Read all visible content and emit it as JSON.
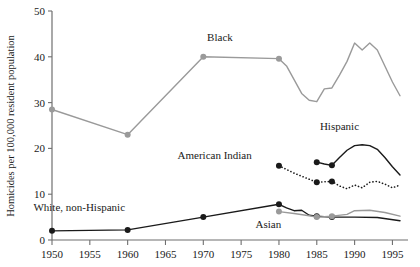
{
  "chart_data": {
    "type": "line",
    "title": "",
    "xlabel": "",
    "ylabel": "Homicides per 100,000 resident population",
    "xlim": [
      1950,
      1996
    ],
    "ylim": [
      0,
      50
    ],
    "yticks": [
      0,
      10,
      20,
      30,
      40,
      50
    ],
    "ytick_labels": [
      "0",
      "10",
      "20",
      "30",
      "40",
      "50"
    ],
    "xticks": [
      1950,
      1955,
      1960,
      1965,
      1970,
      1975,
      1980,
      1985,
      1990,
      1995
    ],
    "xtick_labels": [
      "1950",
      "1955",
      "1960",
      "1965",
      "1970",
      "1975",
      "1980",
      "1985",
      "1990",
      "1995"
    ],
    "grid": false,
    "legend": "inline-annotations",
    "series": [
      {
        "name": "Black",
        "label": "Black",
        "color": "#9a9a9a",
        "style": "solid",
        "marker": "circle",
        "label_x": 1972.2,
        "label_y": 43.5,
        "points": [
          {
            "x": 1950,
            "y": 28.5,
            "marker": true
          },
          {
            "x": 1960,
            "y": 23.0,
            "marker": true
          },
          {
            "x": 1970,
            "y": 40.0,
            "marker": true
          },
          {
            "x": 1980,
            "y": 39.6,
            "marker": true
          },
          {
            "x": 1981,
            "y": 38.0,
            "marker": false
          },
          {
            "x": 1982,
            "y": 35.0,
            "marker": false
          },
          {
            "x": 1983,
            "y": 32.0,
            "marker": false
          },
          {
            "x": 1984,
            "y": 30.5,
            "marker": false
          },
          {
            "x": 1985,
            "y": 30.2,
            "marker": false
          },
          {
            "x": 1986,
            "y": 33.0,
            "marker": false
          },
          {
            "x": 1987,
            "y": 33.2,
            "marker": false
          },
          {
            "x": 1988,
            "y": 36.0,
            "marker": false
          },
          {
            "x": 1989,
            "y": 39.0,
            "marker": false
          },
          {
            "x": 1990,
            "y": 43.0,
            "marker": false
          },
          {
            "x": 1991,
            "y": 41.5,
            "marker": false
          },
          {
            "x": 1992,
            "y": 43.0,
            "marker": false
          },
          {
            "x": 1993,
            "y": 41.5,
            "marker": false
          },
          {
            "x": 1994,
            "y": 38.0,
            "marker": false
          },
          {
            "x": 1995,
            "y": 34.5,
            "marker": false
          },
          {
            "x": 1996,
            "y": 31.5,
            "marker": false
          }
        ]
      },
      {
        "name": "Hispanic",
        "label": "Hispanic",
        "color": "#1a1a1a",
        "style": "solid",
        "marker": "circle",
        "label_x": 1988.0,
        "label_y": 24.0,
        "points": [
          {
            "x": 1985,
            "y": 17.0,
            "marker": true
          },
          {
            "x": 1986,
            "y": 16.6,
            "marker": false
          },
          {
            "x": 1987,
            "y": 16.3,
            "marker": true
          },
          {
            "x": 1988,
            "y": 18.0,
            "marker": false
          },
          {
            "x": 1989,
            "y": 19.6,
            "marker": false
          },
          {
            "x": 1990,
            "y": 20.6,
            "marker": false
          },
          {
            "x": 1991,
            "y": 20.8,
            "marker": false
          },
          {
            "x": 1992,
            "y": 20.6,
            "marker": false
          },
          {
            "x": 1993,
            "y": 19.8,
            "marker": false
          },
          {
            "x": 1994,
            "y": 18.0,
            "marker": false
          },
          {
            "x": 1995,
            "y": 16.0,
            "marker": false
          },
          {
            "x": 1996,
            "y": 14.2,
            "marker": false
          }
        ]
      },
      {
        "name": "American Indian",
        "label": "American Indian",
        "color": "#1a1a1a",
        "style": "dotted",
        "marker": "circle",
        "label_x": 1971.5,
        "label_y": 17.6,
        "points": [
          {
            "x": 1980,
            "y": 16.2,
            "marker": true
          },
          {
            "x": 1982,
            "y": 14.6,
            "marker": false
          },
          {
            "x": 1985,
            "y": 12.6,
            "marker": true
          },
          {
            "x": 1987,
            "y": 12.8,
            "marker": true
          },
          {
            "x": 1988,
            "y": 11.8,
            "marker": false
          },
          {
            "x": 1989,
            "y": 11.2,
            "marker": false
          },
          {
            "x": 1990,
            "y": 12.0,
            "marker": false
          },
          {
            "x": 1991,
            "y": 11.4,
            "marker": false
          },
          {
            "x": 1992,
            "y": 12.6,
            "marker": false
          },
          {
            "x": 1993,
            "y": 12.8,
            "marker": false
          },
          {
            "x": 1994,
            "y": 12.2,
            "marker": false
          },
          {
            "x": 1995,
            "y": 11.4,
            "marker": false
          },
          {
            "x": 1996,
            "y": 12.0,
            "marker": false
          }
        ]
      },
      {
        "name": "White, non-Hispanic",
        "label": "White, non-Hispanic",
        "color": "#1a1a1a",
        "style": "solid",
        "marker": "circle",
        "label_x": 1953.6,
        "label_y": 6.4,
        "points": [
          {
            "x": 1950,
            "y": 2.0,
            "marker": true
          },
          {
            "x": 1960,
            "y": 2.2,
            "marker": true
          },
          {
            "x": 1970,
            "y": 5.0,
            "marker": true
          },
          {
            "x": 1980,
            "y": 7.8,
            "marker": true
          },
          {
            "x": 1981,
            "y": 7.0,
            "marker": false
          },
          {
            "x": 1982,
            "y": 6.4,
            "marker": false
          },
          {
            "x": 1983,
            "y": 6.5,
            "marker": false
          },
          {
            "x": 1984,
            "y": 5.4,
            "marker": false
          },
          {
            "x": 1985,
            "y": 5.2,
            "marker": true
          },
          {
            "x": 1987,
            "y": 5.0,
            "marker": true
          },
          {
            "x": 1990,
            "y": 5.0,
            "marker": false
          },
          {
            "x": 1993,
            "y": 4.9,
            "marker": false
          },
          {
            "x": 1996,
            "y": 4.2,
            "marker": false
          }
        ]
      },
      {
        "name": "Asian",
        "label": "Asian",
        "color": "#9a9a9a",
        "style": "solid",
        "marker": "circle",
        "label_x": 1978.6,
        "label_y": 2.6,
        "points": [
          {
            "x": 1980,
            "y": 6.2,
            "marker": true
          },
          {
            "x": 1982,
            "y": 5.8,
            "marker": false
          },
          {
            "x": 1984,
            "y": 5.3,
            "marker": false
          },
          {
            "x": 1985,
            "y": 5.0,
            "marker": true
          },
          {
            "x": 1987,
            "y": 5.2,
            "marker": true
          },
          {
            "x": 1989,
            "y": 5.6,
            "marker": false
          },
          {
            "x": 1990,
            "y": 6.4,
            "marker": false
          },
          {
            "x": 1992,
            "y": 6.5,
            "marker": false
          },
          {
            "x": 1994,
            "y": 6.0,
            "marker": false
          },
          {
            "x": 1996,
            "y": 5.2,
            "marker": false
          }
        ]
      }
    ]
  }
}
